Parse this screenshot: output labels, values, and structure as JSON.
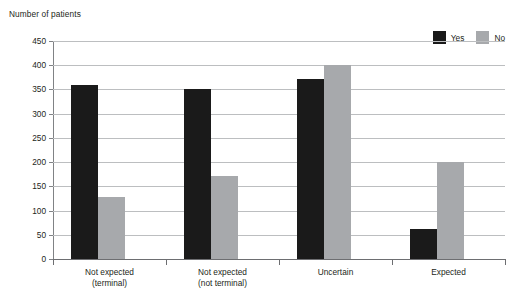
{
  "chart_data": {
    "type": "bar",
    "title": "",
    "ylabel": "Number of patients",
    "xlabel": "",
    "categories": [
      "Not expected (terminal)",
      "Not expected (not terminal)",
      "Uncertain",
      "Expected"
    ],
    "category_lines": [
      [
        "Not expected",
        "(terminal)"
      ],
      [
        "Not expected",
        "(not terminal)"
      ],
      [
        "Uncertain",
        ""
      ],
      [
        "Expected",
        ""
      ]
    ],
    "series": [
      {
        "name": "Yes",
        "color": "#1a1a1a",
        "values": [
          360,
          350,
          372,
          62
        ]
      },
      {
        "name": "No",
        "color": "#a7a9ac",
        "values": [
          127,
          172,
          400,
          200
        ]
      }
    ],
    "ylim": [
      0,
      450
    ],
    "ytick_step": 50,
    "yticks": [
      450,
      400,
      350,
      300,
      250,
      200,
      150,
      100,
      50,
      0
    ],
    "grid": true,
    "legend_position": "top-right"
  }
}
